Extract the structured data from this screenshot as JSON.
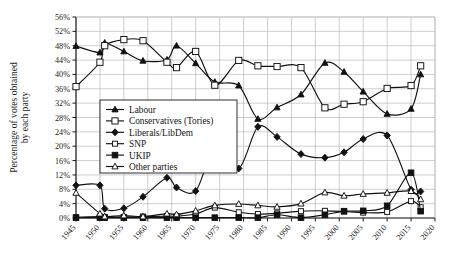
{
  "chart_data": {
    "type": "line",
    "title": "",
    "xlabel": "",
    "ylabel": "Percentage of votes obtained by each party",
    "xlim": [
      1945,
      2020
    ],
    "ylim": [
      0,
      56
    ],
    "grid": true,
    "legend_position": "inside-left",
    "x_tick_labels": [
      "1945",
      "1950",
      "1955",
      "1960",
      "1965",
      "1970",
      "1975",
      "1980",
      "1985",
      "1990",
      "1995",
      "2000",
      "2005",
      "2010",
      "2015",
      "2020"
    ],
    "x_tick_values": [
      1945,
      1950,
      1955,
      1960,
      1965,
      1970,
      1975,
      1980,
      1985,
      1990,
      1995,
      2000,
      2005,
      2010,
      2015,
      2020
    ],
    "y_tick_labels": [
      "0%",
      "4%",
      "8%",
      "12%",
      "16%",
      "20%",
      "24%",
      "28%",
      "32%",
      "36%",
      "40%",
      "44%",
      "48%",
      "52%",
      "56%"
    ],
    "y_tick_values": [
      0,
      4,
      8,
      12,
      16,
      20,
      24,
      28,
      32,
      36,
      40,
      44,
      48,
      52,
      56
    ],
    "election_years": [
      1945,
      1950,
      1951,
      1955,
      1959,
      1964,
      1966,
      1970,
      1974,
      1979,
      1983,
      1987,
      1992,
      1997,
      2001,
      2005,
      2010,
      2015,
      2017
    ],
    "series": [
      {
        "name": "Labour",
        "marker": "filled-triangle",
        "x": [
          1945,
          1950,
          1951,
          1955,
          1959,
          1964,
          1966,
          1970,
          1974,
          1979,
          1983,
          1987,
          1992,
          1997,
          2001,
          2005,
          2010,
          2015,
          2017
        ],
        "values": [
          47.9,
          46.1,
          48.8,
          46.4,
          43.8,
          44.1,
          48.0,
          43.1,
          37.9,
          36.9,
          27.6,
          30.8,
          34.4,
          43.2,
          40.7,
          35.2,
          29.0,
          30.4,
          40.0
        ]
      },
      {
        "name": "Conservatives (Tories)",
        "marker": "open-square-large",
        "x": [
          1945,
          1950,
          1951,
          1955,
          1959,
          1964,
          1966,
          1970,
          1974,
          1979,
          1983,
          1987,
          1992,
          1997,
          2001,
          2005,
          2010,
          2015,
          2017
        ],
        "values": [
          36.6,
          43.4,
          48.0,
          49.7,
          49.4,
          43.4,
          41.9,
          46.4,
          37.0,
          43.9,
          42.4,
          42.2,
          41.9,
          30.7,
          31.7,
          32.4,
          36.1,
          36.9,
          42.4
        ]
      },
      {
        "name": "Liberals/LibDem",
        "marker": "filled-diamond",
        "x": [
          1945,
          1950,
          1951,
          1955,
          1959,
          1964,
          1966,
          1970,
          1974,
          1979,
          1983,
          1987,
          1992,
          1997,
          2001,
          2005,
          2010,
          2015,
          2017
        ],
        "values": [
          9.1,
          9.1,
          2.6,
          2.7,
          5.9,
          11.2,
          8.5,
          7.5,
          19.3,
          13.8,
          25.4,
          22.6,
          17.8,
          16.8,
          18.3,
          22.0,
          23.0,
          7.9,
          7.4
        ]
      },
      {
        "name": "SNP",
        "marker": "open-square-small",
        "x": [
          1945,
          1950,
          1951,
          1955,
          1959,
          1964,
          1966,
          1970,
          1974,
          1979,
          1983,
          1987,
          1992,
          1997,
          2001,
          2005,
          2010,
          2015,
          2017
        ],
        "values": [
          0.2,
          0.4,
          0.3,
          0.3,
          0.4,
          0.5,
          0.5,
          1.1,
          2.9,
          1.6,
          1.1,
          1.3,
          1.9,
          2.0,
          1.8,
          1.5,
          1.7,
          4.7,
          3.0
        ]
      },
      {
        "name": "UKIP",
        "marker": "filled-square",
        "x": [
          1945,
          1950,
          1951,
          1955,
          1959,
          1964,
          1966,
          1970,
          1974,
          1979,
          1983,
          1987,
          1992,
          1997,
          2001,
          2005,
          2010,
          2015,
          2017
        ],
        "values": [
          0.1,
          0.1,
          0.1,
          0.1,
          0.1,
          0.1,
          0.1,
          0.1,
          0.1,
          0.1,
          0.1,
          0.9,
          0.1,
          0.9,
          1.9,
          2.0,
          3.4,
          12.6,
          1.9
        ]
      },
      {
        "name": "Other parties",
        "marker": "open-triangle",
        "x": [
          1945,
          1950,
          1951,
          1955,
          1959,
          1964,
          1966,
          1970,
          1974,
          1979,
          1983,
          1987,
          1992,
          1997,
          2001,
          2005,
          2010,
          2015,
          2017
        ],
        "values": [
          7.0,
          1.2,
          0.4,
          0.7,
          0.4,
          1.2,
          1.0,
          2.0,
          3.5,
          3.9,
          3.5,
          3.1,
          4.0,
          7.1,
          6.2,
          6.7,
          7.0,
          7.5,
          5.2
        ]
      }
    ]
  },
  "legend": {
    "items": [
      {
        "label": "Labour",
        "marker": "filled-triangle"
      },
      {
        "label": "Conservatives (Tories)",
        "marker": "open-square-large"
      },
      {
        "label": "Liberals/LibDem",
        "marker": "filled-diamond"
      },
      {
        "label": "SNP",
        "marker": "open-square-small"
      },
      {
        "label": "UKIP",
        "marker": "filled-square"
      },
      {
        "label": "Other parties",
        "marker": "open-triangle"
      }
    ]
  },
  "axes": {
    "y_title": "Percentage of votes obtained by each party",
    "y_title_line1": "Percentage of votes obtained",
    "y_title_line2": "by each party"
  },
  "colors": {
    "ink": "#111111",
    "grid": "#b9b9b9",
    "background": "#ffffff"
  }
}
